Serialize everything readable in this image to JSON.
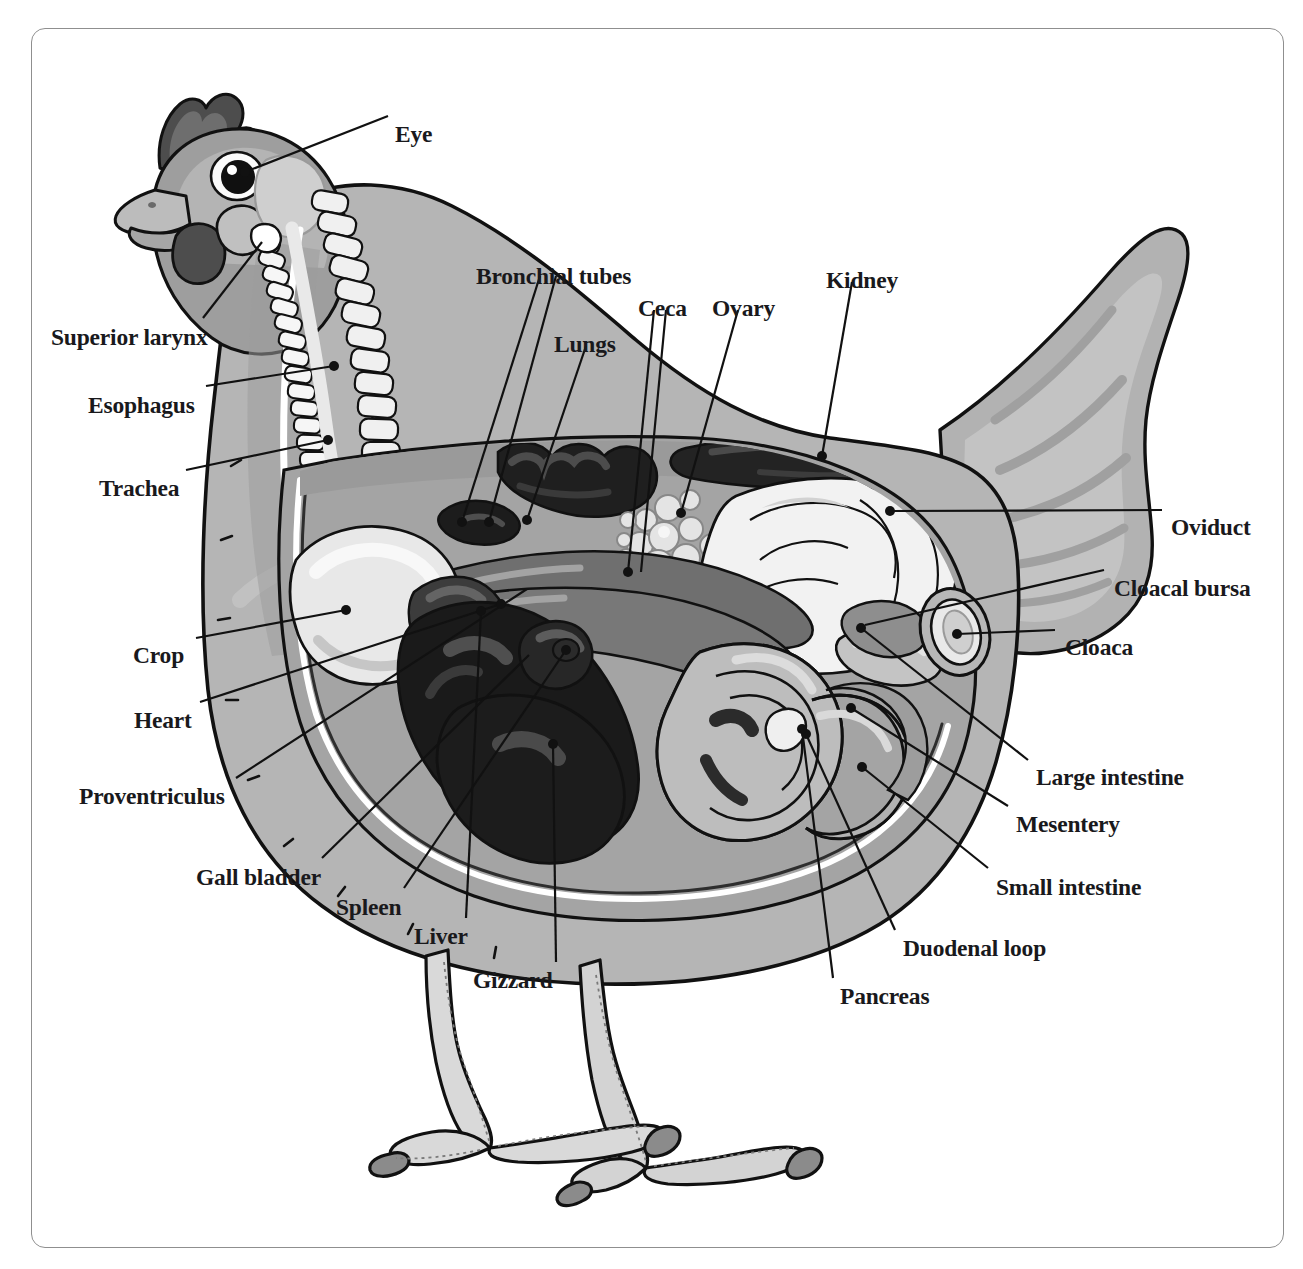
{
  "document": {
    "title": "Chicken Internal Anatomy",
    "type": "labeled anatomical diagram",
    "subject": "hen (female chicken), left lateral cutaway view",
    "border_color": "#8f8f8f",
    "background_color": "#ffffff",
    "label_color": "#19191c",
    "leader_line_color": "#111111"
  },
  "palette": {
    "outline": "#111111",
    "feather_light": "#cfcfcf",
    "feather_mid": "#a8a8a8",
    "feather_dark": "#8e8e8e",
    "skin_light": "#dedede",
    "body_cavity": "#9b9b9b",
    "organ_white": "#f4f4f4",
    "organ_cream": "#e6e6e6",
    "organ_pale": "#c6c6c6",
    "organ_mid": "#9a9a9a",
    "organ_dark": "#5e5e5e",
    "organ_very_dark": "#2a2a2a",
    "organ_black": "#1a1a1a",
    "comb_dark": "#4a4a4a",
    "beak": "#b5b5b5",
    "leg": "#d5d5d5",
    "claw": "#8a8a8a",
    "highlight_white": "#ffffff"
  },
  "labels": [
    {
      "id": "eye",
      "text": "Eye",
      "x": 395,
      "y": 123,
      "align": "left",
      "target_x": 237,
      "target_y": 175
    },
    {
      "id": "bronchial-tubes",
      "text": "Bronchial tubes",
      "x": 476,
      "y": 265,
      "align": "left",
      "target_x": 463,
      "target_y": 520
    },
    {
      "id": "ceca",
      "text": "Ceca",
      "x": 638,
      "y": 297,
      "align": "left",
      "target_x": 631,
      "target_y": 572
    },
    {
      "id": "ovary",
      "text": "Ovary",
      "x": 712,
      "y": 297,
      "align": "left",
      "target_x": 681,
      "target_y": 513
    },
    {
      "id": "kidney",
      "text": "Kidney",
      "x": 826,
      "y": 269,
      "align": "left",
      "target_x": 822,
      "target_y": 456
    },
    {
      "id": "lungs",
      "text": "Lungs",
      "x": 554,
      "y": 333,
      "align": "left",
      "target_x": 488,
      "target_y": 521
    },
    {
      "id": "superior-larynx",
      "text": "Superior larynx",
      "x": 51,
      "y": 326,
      "align": "left",
      "target_x": 262,
      "target_y": 241
    },
    {
      "id": "esophagus",
      "text": "Esophagus",
      "x": 88,
      "y": 394,
      "align": "left",
      "target_x": 334,
      "target_y": 366
    },
    {
      "id": "trachea",
      "text": "Trachea",
      "x": 99,
      "y": 477,
      "align": "left",
      "target_x": 328,
      "target_y": 440
    },
    {
      "id": "oviduct",
      "text": "Oviduct",
      "x": 1171,
      "y": 516,
      "align": "left",
      "target_x": 891,
      "target_y": 511
    },
    {
      "id": "cloacal-bursa",
      "text": "Cloacal bursa",
      "x": 1114,
      "y": 577,
      "align": "left",
      "target_x": 864,
      "target_y": 625
    },
    {
      "id": "cloaca",
      "text": "Cloaca",
      "x": 1065,
      "y": 636,
      "align": "left",
      "target_x": 957,
      "target_y": 634
    },
    {
      "id": "crop",
      "text": "Crop",
      "x": 133,
      "y": 644,
      "align": "left",
      "target_x": 346,
      "target_y": 610
    },
    {
      "id": "heart",
      "text": "Heart",
      "x": 134,
      "y": 709,
      "align": "left",
      "target_x": 501,
      "target_y": 604
    },
    {
      "id": "proventriculus",
      "text": "Proventriculus",
      "x": 79,
      "y": 785,
      "align": "left",
      "target_x": 527,
      "target_y": 589
    },
    {
      "id": "large-intestine",
      "text": "Large intestine",
      "x": 1036,
      "y": 766,
      "align": "left",
      "target_x": 861,
      "target_y": 628
    },
    {
      "id": "mesentery",
      "text": "Mesentery",
      "x": 1016,
      "y": 813,
      "align": "left",
      "target_x": 851,
      "target_y": 708
    },
    {
      "id": "gall-bladder",
      "text": "Gall bladder",
      "x": 196,
      "y": 866,
      "align": "left",
      "target_x": 529,
      "target_y": 655
    },
    {
      "id": "small-intestine",
      "text": "Small intestine",
      "x": 996,
      "y": 876,
      "align": "left",
      "target_x": 862,
      "target_y": 767
    },
    {
      "id": "spleen",
      "text": "Spleen",
      "x": 336,
      "y": 896,
      "align": "left",
      "target_x": 566,
      "target_y": 650
    },
    {
      "id": "liver",
      "text": "Liver",
      "x": 414,
      "y": 925,
      "align": "left",
      "target_x": 481,
      "target_y": 611
    },
    {
      "id": "duodenal-loop",
      "text": "Duodenal loop",
      "x": 903,
      "y": 937,
      "align": "left",
      "target_x": 803,
      "target_y": 731
    },
    {
      "id": "gizzard",
      "text": "Gizzard",
      "x": 473,
      "y": 969,
      "align": "left",
      "target_x": 553,
      "target_y": 744
    },
    {
      "id": "pancreas",
      "text": "Pancreas",
      "x": 840,
      "y": 985,
      "align": "left",
      "target_x": 805,
      "target_y": 731
    }
  ],
  "organ_list": [
    "Eye",
    "Superior larynx",
    "Esophagus",
    "Trachea",
    "Bronchial tubes",
    "Lungs",
    "Ceca",
    "Ovary",
    "Kidney",
    "Oviduct",
    "Cloacal bursa",
    "Cloaca",
    "Crop",
    "Heart",
    "Proventriculus",
    "Gall bladder",
    "Spleen",
    "Liver",
    "Gizzard",
    "Pancreas",
    "Duodenal loop",
    "Small intestine",
    "Mesentery",
    "Large intestine"
  ]
}
